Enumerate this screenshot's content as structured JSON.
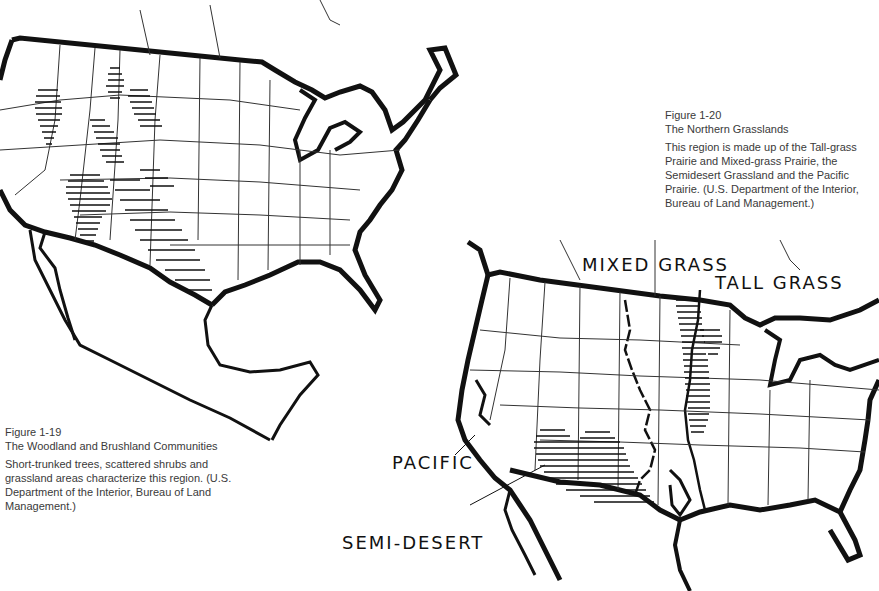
{
  "figures": [
    {
      "id": "fig-1-19",
      "number": "Figure 1-19",
      "title": "The Woodland and Brushland Communities",
      "description": "Short-trunked trees, scattered shrubs and grassland areas characterize this region. (U.S. Department of the Interior, Bureau of Land Management.)"
    },
    {
      "id": "fig-1-20",
      "number": "Figure 1-20",
      "title": "The Northern Grasslands",
      "description": "This region is made up of the Tall-grass Prairie and Mixed-grass Prairie, the Semidesert Grassland and the Pacific Prairie. (U.S. Department of the Interior, Bureau of Land Management.)"
    }
  ],
  "map_labels": {
    "mixed_grass": "MIXED GRASS",
    "tall_grass": "TALL GRASS",
    "pacific": "PACIFIC",
    "semi_desert": "SEMI-DESERT"
  },
  "colors": {
    "ink": "#111111",
    "paper": "#ffffff",
    "caption": "#3a3a3a"
  }
}
